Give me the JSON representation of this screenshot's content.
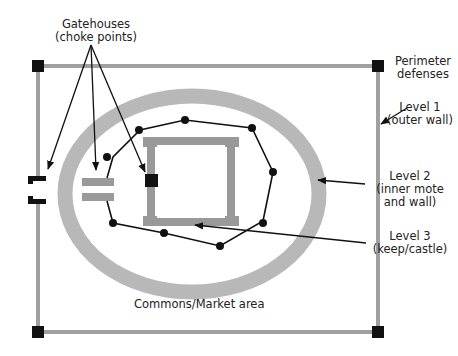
{
  "labels": {
    "gatehouses": {
      "line1": "Gatehouses",
      "line2": "(choke points)"
    },
    "perimeter": {
      "line1": "Perimeter",
      "line2": "defenses"
    },
    "level1": {
      "line1": "Level 1",
      "line2": "(outer wall)"
    },
    "level2": {
      "line1": "Level 2",
      "line2": "(inner mote",
      "line3": "and wall)"
    },
    "level3": {
      "line1": "Level 3",
      "line2": "(keep/castle)"
    },
    "commons": "Commons/Market area"
  },
  "colors": {
    "wall_gray": "#a0a0a0",
    "moat_gray": "#b8b8b8",
    "keep_gray": "#999999",
    "tower_black": "#111111",
    "line_black": "#111111"
  }
}
